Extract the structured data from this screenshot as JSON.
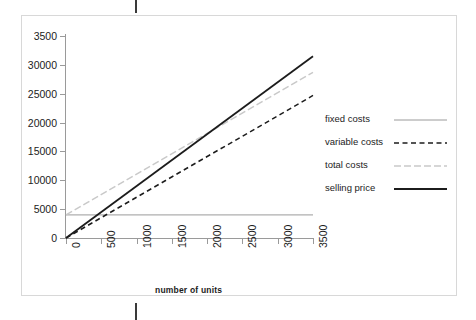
{
  "figure": {
    "background": "#ffffff",
    "border_color": "#d8d8d8"
  },
  "axis_title_x": "number of units",
  "legend": {
    "items": [
      {
        "label": "fixed costs",
        "style": "solid-thin",
        "color": "#9a9a9a"
      },
      {
        "label": "variable costs",
        "style": "dashed",
        "color": "#1c1c1c"
      },
      {
        "label": "total costs",
        "style": "dash-dot",
        "color": "#c9c9c9"
      },
      {
        "label": "selling price",
        "style": "solid-thick",
        "color": "#1c1c1c"
      }
    ]
  },
  "chart_data": {
    "type": "line",
    "title": "",
    "xlabel": "number of units",
    "ylabel": "",
    "xlim": [
      0,
      3500
    ],
    "ylim": [
      0,
      35000
    ],
    "grid": false,
    "legend_position": "right",
    "x_ticks": [
      0,
      500,
      1000,
      1500,
      2000,
      2500,
      3000,
      3500
    ],
    "x_tick_labels": [
      "0",
      "500",
      "1000",
      "1500",
      "2000",
      "2500",
      "3000",
      "3500"
    ],
    "y_ticks": [
      0,
      5000,
      10000,
      15000,
      20000,
      25000,
      30000,
      35000
    ],
    "y_tick_labels": [
      "0",
      "5000",
      "10000",
      "15000",
      "20000",
      "25000",
      "30000",
      "3500"
    ],
    "x": [
      0,
      3500
    ],
    "series": [
      {
        "name": "fixed costs",
        "values": [
          4000,
          4000
        ],
        "color": "#9a9a9a",
        "style": "solid-thin"
      },
      {
        "name": "variable costs",
        "values": [
          0,
          24700
        ],
        "color": "#1c1c1c",
        "style": "dashed"
      },
      {
        "name": "total costs",
        "values": [
          4000,
          28700
        ],
        "color": "#c9c9c9",
        "style": "dash-dot"
      },
      {
        "name": "selling price",
        "values": [
          0,
          31500
        ],
        "color": "#1c1c1c",
        "style": "solid-thick"
      }
    ]
  }
}
